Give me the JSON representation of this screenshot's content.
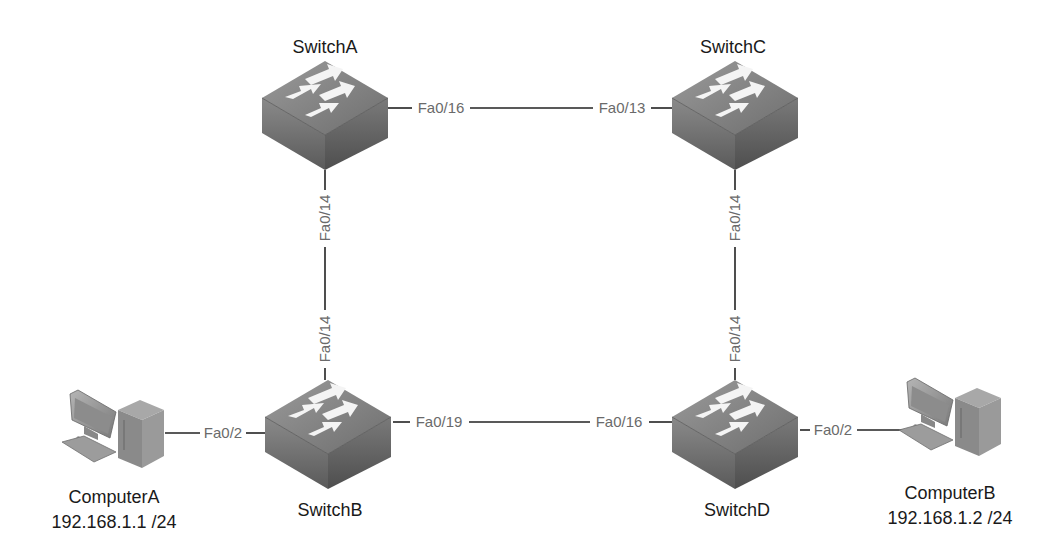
{
  "diagram": {
    "type": "network-topology",
    "nodes": [
      {
        "id": "switchA",
        "label": "SwitchA",
        "kind": "switch"
      },
      {
        "id": "switchB",
        "label": "SwitchB",
        "kind": "switch"
      },
      {
        "id": "switchC",
        "label": "SwitchC",
        "kind": "switch"
      },
      {
        "id": "switchD",
        "label": "SwitchD",
        "kind": "switch"
      },
      {
        "id": "computerA",
        "label": "ComputerA",
        "ip": "192.168.1.1 /24",
        "kind": "computer"
      },
      {
        "id": "computerB",
        "label": "ComputerB",
        "ip": "192.168.1.2 /24",
        "kind": "computer"
      }
    ],
    "links": [
      {
        "from": "switchA",
        "from_port": "Fa0/16",
        "to": "switchC",
        "to_port": "Fa0/13"
      },
      {
        "from": "switchA",
        "from_port": "Fa0/14",
        "to": "switchB",
        "to_port": "Fa0/14"
      },
      {
        "from": "switchC",
        "from_port": "Fa0/14",
        "to": "switchD",
        "to_port": "Fa0/14"
      },
      {
        "from": "switchB",
        "from_port": "Fa0/19",
        "to": "switchD",
        "to_port": "Fa0/16"
      },
      {
        "from": "computerA",
        "to": "switchB",
        "to_port": "Fa0/2"
      },
      {
        "from": "switchD",
        "from_port": "Fa0/2",
        "to": "computerB"
      }
    ]
  },
  "labels": {
    "switchA": "SwitchA",
    "switchB": "SwitchB",
    "switchC": "SwitchC",
    "switchD": "SwitchD",
    "computerA": "ComputerA",
    "computerA_ip": "192.168.1.1 /24",
    "computerB": "ComputerB",
    "computerB_ip": "192.168.1.2 /24"
  },
  "ports": {
    "a_to_c": "Fa0/16",
    "c_to_a": "Fa0/13",
    "a_to_b": "Fa0/14",
    "b_to_a": "Fa0/14",
    "c_to_d": "Fa0/14",
    "d_to_c": "Fa0/14",
    "b_to_d": "Fa0/19",
    "d_to_b": "Fa0/16",
    "b_to_pcA": "Fa0/2",
    "d_to_pcB": "Fa0/2"
  },
  "colors": {
    "line": "#222222",
    "port_text": "#6a6a6a",
    "node_text": "#1a1a1a"
  }
}
